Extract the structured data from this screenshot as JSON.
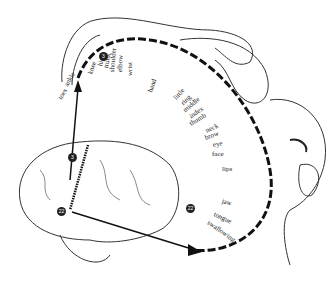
{
  "diagram": {
    "type": "sensory-homunculus",
    "labels_arc_upper": [
      "toes",
      "ankle",
      "knee",
      "hip",
      "trunk",
      "shoulder",
      "elbow",
      "wrist",
      "hand"
    ],
    "labels_arc_fingers": [
      "little",
      "ring",
      "middle",
      "index",
      "thumb",
      "neck",
      "brow",
      "eye",
      "face"
    ],
    "labels_arc_lower": [
      "lips",
      "jaw",
      "tongue",
      "swallowing"
    ],
    "badges": {
      "a": "3",
      "b": "22"
    }
  }
}
